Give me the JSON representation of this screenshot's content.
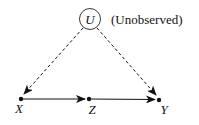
{
  "diagram": {
    "type": "causal-dag",
    "nodes": [
      {
        "id": "U",
        "label": "U",
        "annotation": "(Unobserved)",
        "shape": "circle"
      },
      {
        "id": "X",
        "label": "X",
        "shape": "point"
      },
      {
        "id": "Z",
        "label": "Z",
        "shape": "point"
      },
      {
        "id": "Y",
        "label": "Y",
        "shape": "point"
      }
    ],
    "edges": [
      {
        "from": "U",
        "to": "X",
        "style": "dashed"
      },
      {
        "from": "U",
        "to": "Y",
        "style": "dashed"
      },
      {
        "from": "X",
        "to": "Z",
        "style": "solid"
      },
      {
        "from": "Z",
        "to": "Y",
        "style": "solid"
      }
    ],
    "colors": {
      "stroke": "#111111",
      "background": "#ffffff"
    }
  }
}
